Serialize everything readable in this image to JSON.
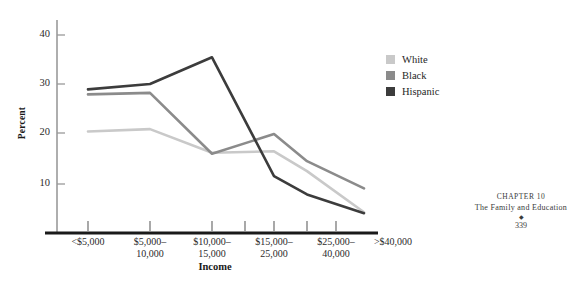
{
  "chart_data": {
    "type": "line",
    "title": "",
    "xlabel": "Income",
    "ylabel": "Percent",
    "categories": [
      "<$5,000",
      "$5,000–\n10,000",
      "$10,000–\n15,000",
      "$15,000–\n25,000",
      "$25,000–\n40,000",
      ">$40,000"
    ],
    "ytick_labels": [
      "10",
      "20",
      "30",
      "40"
    ],
    "yticks": [
      10,
      20,
      30,
      40
    ],
    "ylim": [
      0,
      45
    ],
    "grid": false,
    "legend_position": "upper-right",
    "series": [
      {
        "name": "White",
        "color": "#c9c9c9",
        "values": [
          20.5,
          21.0,
          16.2,
          16.5,
          12.5,
          4.2
        ]
      },
      {
        "name": "Black",
        "color": "#8b8b8b",
        "values": [
          28.0,
          28.3,
          16.0,
          20.0,
          14.5,
          9.0
        ]
      },
      {
        "name": "Hispanic",
        "color": "#3c3c3c",
        "values": [
          29.0,
          30.1,
          35.5,
          11.5,
          7.8,
          4.0
        ]
      }
    ]
  },
  "legend": {
    "items": [
      {
        "label": "White",
        "color": "#c9c9c9"
      },
      {
        "label": "Black",
        "color": "#8b8b8b"
      },
      {
        "label": "Hispanic",
        "color": "#3c3c3c"
      }
    ]
  },
  "axes": {
    "y_title": "Percent",
    "x_title": "Income",
    "y_tick_1": "10",
    "y_tick_2": "20",
    "y_tick_3": "30",
    "y_tick_4": "40",
    "x_tick_1": "<$5,000",
    "x_tick_2": "$5,000–\n10,000",
    "x_tick_3": "$10,000–\n15,000",
    "x_tick_4": "$15,000–\n25,000",
    "x_tick_5": "$25,000–\n40,000",
    "x_tick_6": ">$40,000"
  },
  "footer": {
    "chapter": "CHAPTER 10",
    "title": "The Family and Education",
    "ornament": "◆",
    "page": "339"
  },
  "colors": {
    "axis": "#9a9a9a",
    "baseline": "#1a1a1a",
    "text": "#262626"
  }
}
